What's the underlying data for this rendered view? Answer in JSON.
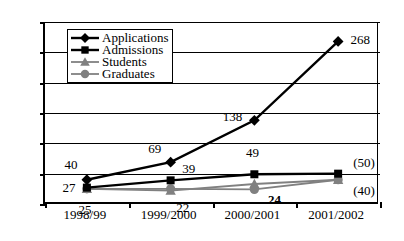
{
  "chart_data": {
    "type": "line",
    "title": "",
    "xlabel": "",
    "ylabel": "",
    "categories": [
      "1998/99",
      "1999/2000",
      "2000/2001",
      "2001/2002"
    ],
    "ylim": [
      0,
      300
    ],
    "ytick_step": 50,
    "yticks": [
      "300",
      "250",
      "200",
      "150",
      "100",
      "50",
      "0"
    ],
    "grid": true,
    "legend_position": "upper-left-inside",
    "series": [
      {
        "name": "Applications",
        "marker": "diamond",
        "color": "#000000",
        "values": [
          40,
          69,
          138,
          268
        ],
        "labels": [
          "40",
          "69",
          "138",
          "268"
        ]
      },
      {
        "name": "Admissions",
        "marker": "square",
        "color": "#000000",
        "values": [
          27,
          39,
          49,
          50
        ],
        "labels": [
          "27",
          "39",
          "49",
          "(50)"
        ]
      },
      {
        "name": "Students",
        "marker": "triangle",
        "color": "#808080",
        "values": [
          25,
          22,
          33,
          40
        ],
        "labels": [
          "25",
          "22",
          "",
          "(40)"
        ]
      },
      {
        "name": "Graduates",
        "marker": "circle",
        "color": "#808080",
        "values": [
          25,
          25,
          24,
          40
        ],
        "labels": [
          "",
          "",
          "24",
          ""
        ]
      }
    ],
    "annotations": [
      {
        "text": "40",
        "x_category": "1998/99",
        "value": 40,
        "bold": false
      },
      {
        "text": "27",
        "x_category": "1998/99",
        "value": 27,
        "bold": false
      },
      {
        "text": "25",
        "x_category": "1998/99",
        "value": 25,
        "bold": false
      },
      {
        "text": "69",
        "x_category": "1999/2000",
        "value": 69,
        "bold": false
      },
      {
        "text": "39",
        "x_category": "1999/2000",
        "value": 39,
        "bold": false
      },
      {
        "text": "22",
        "x_category": "1999/2000",
        "value": 22,
        "bold": false
      },
      {
        "text": "138",
        "x_category": "2000/2001",
        "value": 138,
        "bold": false
      },
      {
        "text": "49",
        "x_category": "2000/2001",
        "value": 49,
        "bold": false
      },
      {
        "text": "24",
        "x_category": "2000/2001",
        "value": 24,
        "bold": true
      },
      {
        "text": "268",
        "x_category": "2001/2002",
        "value": 268,
        "bold": false
      },
      {
        "text": "(50)",
        "x_category": "2001/2002",
        "value": 50,
        "bold": false
      },
      {
        "text": "(40)",
        "x_category": "2001/2002",
        "value": 40,
        "bold": false
      }
    ]
  },
  "legend": {
    "items": [
      {
        "label": "Applications",
        "marker": "diamond",
        "color": "#000000"
      },
      {
        "label": "Admissions",
        "marker": "square",
        "color": "#000000"
      },
      {
        "label": "Students",
        "marker": "triangle",
        "color": "#808080"
      },
      {
        "label": "Graduates",
        "marker": "circle",
        "color": "#808080"
      }
    ]
  },
  "axis": {
    "y_labels": [
      "300",
      "250",
      "200",
      "150",
      "100",
      "50",
      "0"
    ],
    "x_labels": [
      "1998/99",
      "1999/2000",
      "2000/2001",
      "2001/2002"
    ]
  },
  "value_labels": {
    "c0": {
      "applications": "40",
      "admissions": "27",
      "students": "25"
    },
    "c1": {
      "applications": "69",
      "admissions": "39",
      "students": "22"
    },
    "c2": {
      "applications": "138",
      "admissions": "49",
      "graduates": "24"
    },
    "c3": {
      "applications": "268",
      "admissions": "(50)",
      "students": "(40)"
    }
  }
}
